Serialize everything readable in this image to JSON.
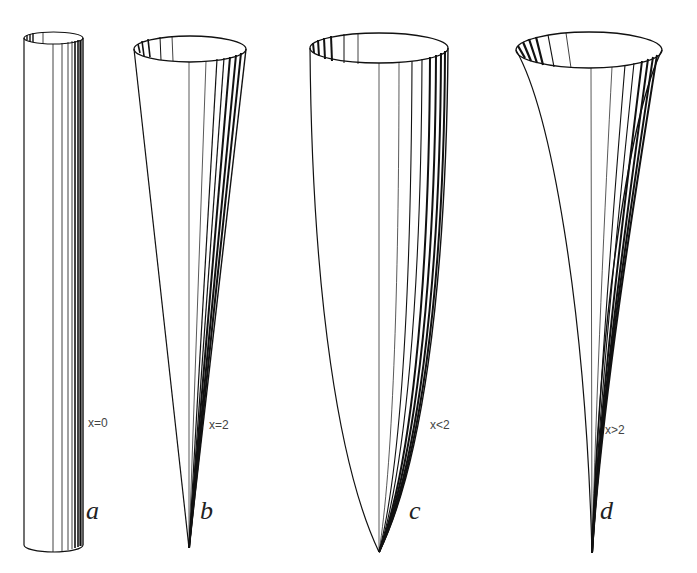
{
  "figure": {
    "panels": [
      {
        "id": "a",
        "letter": "a",
        "condition": "x=0",
        "shape": "cylinder"
      },
      {
        "id": "b",
        "letter": "b",
        "condition": "x=2",
        "shape": "cone"
      },
      {
        "id": "c",
        "letter": "c",
        "condition": "x<2",
        "shape": "convex-bowl"
      },
      {
        "id": "d",
        "letter": "d",
        "condition": "x>2",
        "shape": "concave-horn"
      }
    ]
  }
}
